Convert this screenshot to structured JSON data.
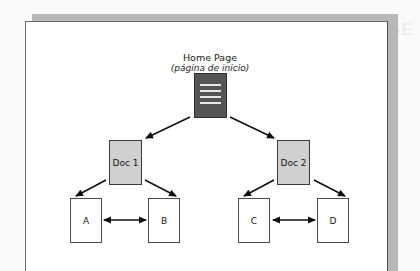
{
  "diagram": {
    "type": "site-hierarchy",
    "root": {
      "title": "Home Page",
      "subtitle": "(página de inicio)",
      "icon": "document-lines-icon"
    },
    "level1": [
      {
        "id": "doc1",
        "label": "Doc 1"
      },
      {
        "id": "doc2",
        "label": "Doc 2"
      }
    ],
    "level2": [
      {
        "id": "a",
        "label": "A",
        "parent": "doc1"
      },
      {
        "id": "b",
        "label": "B",
        "parent": "doc1"
      },
      {
        "id": "c",
        "label": "C",
        "parent": "doc2"
      },
      {
        "id": "d",
        "label": "D",
        "parent": "doc2"
      }
    ],
    "edges": [
      {
        "from": "home",
        "to": "doc1",
        "type": "arrow"
      },
      {
        "from": "home",
        "to": "doc2",
        "type": "arrow"
      },
      {
        "from": "doc1",
        "to": "a",
        "type": "arrow"
      },
      {
        "from": "doc1",
        "to": "b",
        "type": "arrow"
      },
      {
        "from": "doc2",
        "to": "c",
        "type": "arrow"
      },
      {
        "from": "doc2",
        "to": "d",
        "type": "arrow"
      },
      {
        "from": "a",
        "to": "b",
        "type": "bidirectional"
      },
      {
        "from": "c",
        "to": "d",
        "type": "bidirectional"
      }
    ],
    "colors": {
      "root_fill": "#555555",
      "level1_fill": "#cfcfcf",
      "level2_fill": "#ffffff",
      "frame_shadow": "#b8b8b8",
      "stroke": "#1a1a1a"
    }
  }
}
